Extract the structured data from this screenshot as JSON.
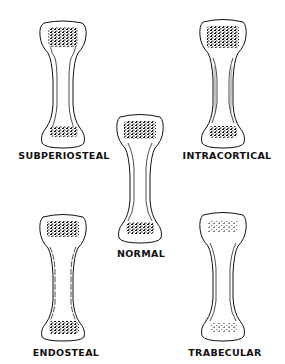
{
  "figure": {
    "panels": [
      {
        "id": "subperiosteal",
        "label": "SUBPERIOSTEAL",
        "position": "top-left"
      },
      {
        "id": "intracortical",
        "label": "INTRACORTICAL",
        "position": "top-right"
      },
      {
        "id": "normal",
        "label": "NORMAL",
        "position": "center"
      },
      {
        "id": "endosteal",
        "label": "ENDOSTEAL",
        "position": "bottom-left"
      },
      {
        "id": "trabecular",
        "label": "TRABECULAR",
        "position": "bottom-right"
      }
    ],
    "colors": {
      "ink": "#111111",
      "background": "#ffffff"
    }
  }
}
